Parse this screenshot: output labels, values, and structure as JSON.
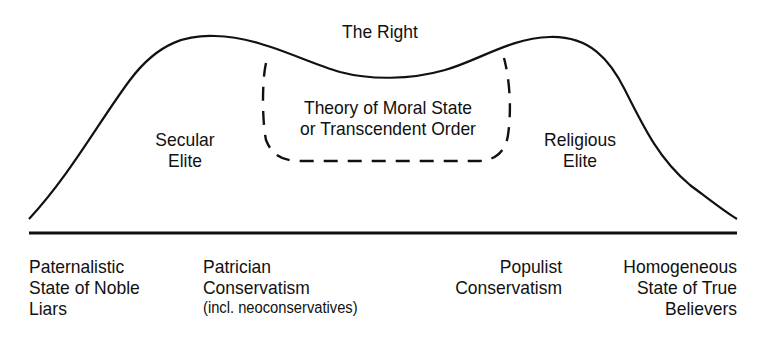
{
  "diagram": {
    "title": "The Right",
    "curve_labels": {
      "left_peak": [
        "Secular",
        "Elite"
      ],
      "right_peak": [
        "Religious",
        "Elite"
      ],
      "center_box": [
        "Theory of Moral State",
        "or Transcendent Order"
      ]
    },
    "axis_labels": [
      {
        "lines": [
          "Paternalistic",
          "State of Noble",
          "Liars"
        ],
        "align": "left"
      },
      {
        "lines": [
          "Patrician",
          "Conservatism",
          "(incl. neoconservatives)"
        ],
        "align": "left"
      },
      {
        "lines": [
          "Populist",
          "Conservatism"
        ],
        "align": "right"
      },
      {
        "lines": [
          "Homogeneous",
          "State of True",
          "Believers"
        ],
        "align": "right"
      }
    ],
    "colors": {
      "line": "#111111",
      "background": "#ffffff"
    }
  }
}
